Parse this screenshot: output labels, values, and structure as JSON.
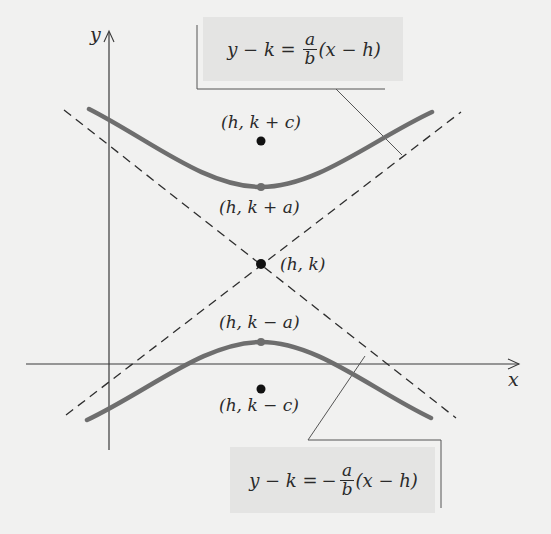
{
  "figure": {
    "axes": {
      "x_label": "x",
      "y_label": "y"
    },
    "points": [
      {
        "id": "focus-upper",
        "label": "(h, k + c)",
        "style": "filled-black"
      },
      {
        "id": "vertex-upper",
        "label": "(h, k + a)",
        "style": "on-curve"
      },
      {
        "id": "center",
        "label": "(h, k)",
        "style": "filled-black"
      },
      {
        "id": "vertex-lower",
        "label": "(h, k − a)",
        "style": "on-curve"
      },
      {
        "id": "focus-lower",
        "label": "(h, k − c)",
        "style": "filled-black"
      }
    ],
    "asymptotes": {
      "positive": {
        "lhs": "y − k =",
        "sign": "",
        "numerator": "a",
        "denominator": "b",
        "rhs": "(x − h)"
      },
      "negative": {
        "lhs": "y − k =",
        "sign": "−",
        "numerator": "a",
        "denominator": "b",
        "rhs": "(x − h)"
      }
    },
    "colors": {
      "curve": "#6e6e6e",
      "asymptote": "#2e2e2e",
      "axis": "#3a3a3a",
      "point": "#111111",
      "box": "#e4e4e3",
      "background": "#f1f1f0"
    }
  }
}
